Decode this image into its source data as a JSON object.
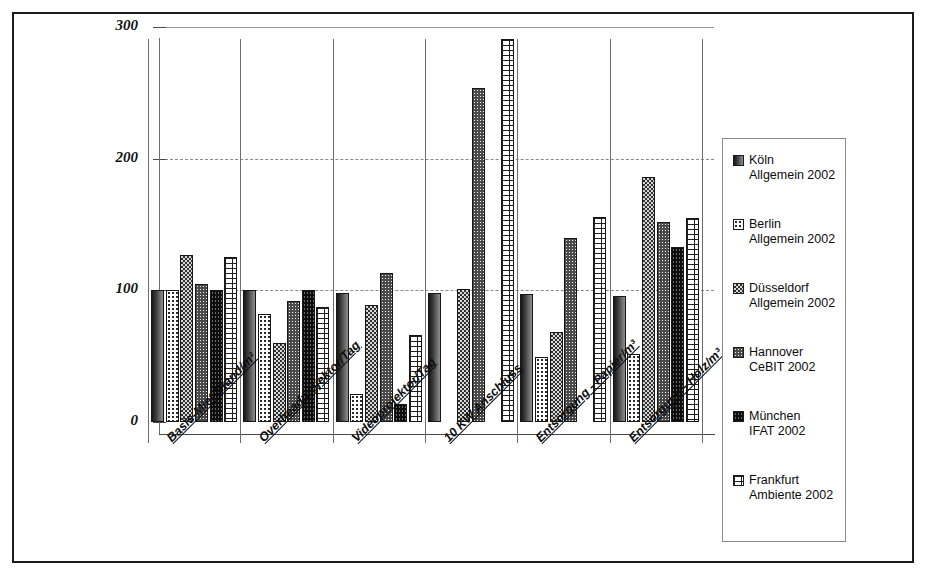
{
  "chart_data": {
    "type": "bar",
    "title": "",
    "xlabel": "",
    "ylabel": "",
    "ylim": [
      0,
      300
    ],
    "yticks": [
      "0",
      "100",
      "200",
      "300"
    ],
    "grid": "horizontal dashed gridlines at 100 and 200",
    "legend_position": "right",
    "categories": [
      "Basis-Miet-Stand/m²",
      "Overheadprojektor/Tag",
      "Videoprojektor/Tag",
      "10 KW Anschluss",
      "Entsorgung - Papier/m³",
      "Entsorgung - Holz/m³"
    ],
    "series": [
      {
        "name": "Köln Allgemein 2002",
        "name_line1": "Köln",
        "name_line2": "Allgemein 2002",
        "values": [
          100,
          100,
          98,
          98,
          97,
          96
        ]
      },
      {
        "name": "Berlin Allgemein 2002",
        "name_line1": "Berlin",
        "name_line2": "Allgemein 2002",
        "values": [
          100,
          82,
          21,
          0,
          49,
          52
        ]
      },
      {
        "name": "Düsseldorf Allgemein 2002",
        "name_line1": "Düsseldorf",
        "name_line2": "Allgemein 2002",
        "values": [
          127,
          60,
          89,
          101,
          68,
          186
        ]
      },
      {
        "name": "Hannover CeBIT 2002",
        "name_line1": "Hannover",
        "name_line2": "CeBIT 2002",
        "values": [
          105,
          92,
          113,
          254,
          140,
          152
        ]
      },
      {
        "name": "München IFAT 2002",
        "name_line1": "München",
        "name_line2": "IFAT 2002",
        "values": [
          100,
          100,
          14,
          0,
          0,
          133
        ]
      },
      {
        "name": "Frankfurt Ambiente 2002",
        "name_line1": "Frankfurt",
        "name_line2": "Ambiente 2002",
        "values": [
          125,
          87,
          66,
          291,
          156,
          155
        ]
      }
    ]
  },
  "colors": {
    "frame": "#1b1b1b",
    "axis": "#4a4a4a",
    "grid": "#8a8a8a",
    "bar_outline": "#171717"
  }
}
